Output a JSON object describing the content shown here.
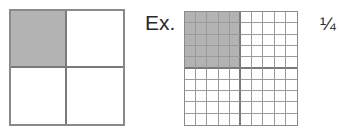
{
  "colors": {
    "shade": "#b3b3b3",
    "line": "#8a8a8a",
    "background": "#ffffff"
  },
  "left_diagram": {
    "rows": 2,
    "cols": 2,
    "shaded_cells": [
      [
        0,
        0
      ]
    ]
  },
  "example": {
    "label": "Ex.",
    "fraction": "¼",
    "grid": {
      "rows": 10,
      "cols": 10,
      "shaded_block": {
        "row_start": 0,
        "row_end": 4,
        "col_start": 0,
        "col_end": 4
      }
    }
  }
}
